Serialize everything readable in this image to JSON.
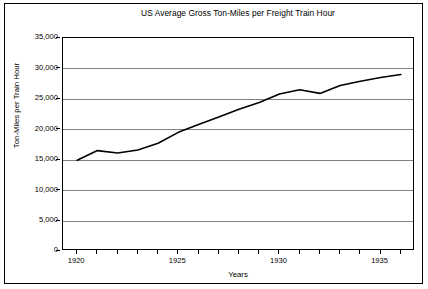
{
  "chart_data": {
    "type": "line",
    "title": "US Average Gross Ton-Miles per Freight Train Hour",
    "xlabel": "Years",
    "ylabel": "Ton-Miles per Train Hour",
    "x": [
      1920,
      1921,
      1922,
      1923,
      1924,
      1925,
      1926,
      1927,
      1928,
      1929,
      1930,
      1931,
      1932,
      1933,
      1934,
      1935,
      1936
    ],
    "values": [
      14900,
      16500,
      16100,
      16600,
      17700,
      19500,
      20800,
      22000,
      23300,
      24400,
      25800,
      26500,
      25900,
      27200,
      27900,
      28500,
      29000
    ],
    "series": [
      {
        "name": "US Average Gross Ton-Miles per Freight Train Hour",
        "values": [
          14900,
          16500,
          16100,
          16600,
          17700,
          19500,
          20800,
          22000,
          23300,
          24400,
          25800,
          26500,
          25900,
          27200,
          27900,
          28500,
          29000
        ]
      }
    ],
    "xlim": [
      1919.3,
      1936.7
    ],
    "ylim": [
      0,
      35000
    ],
    "y_ticks": [
      0,
      5000,
      10000,
      15000,
      20000,
      25000,
      30000,
      35000
    ],
    "y_tick_labels": [
      "0",
      "5,000",
      "10,000",
      "15,000",
      "20,000",
      "25,000",
      "30,000",
      "35,000"
    ],
    "x_ticks": [
      1920,
      1921,
      1922,
      1923,
      1924,
      1925,
      1926,
      1927,
      1928,
      1929,
      1930,
      1931,
      1932,
      1933,
      1934,
      1935,
      1936
    ],
    "x_tick_labels_shown": [
      {
        "value": 1920,
        "label": "1920"
      },
      {
        "value": 1925,
        "label": "1925"
      },
      {
        "value": 1930,
        "label": "1930"
      },
      {
        "value": 1935,
        "label": "1935"
      }
    ],
    "grid": "horizontal",
    "legend": "none",
    "colors": {
      "line": "#000000",
      "gridline": "#808080",
      "axis": "#000000",
      "plot_background": "#ffffff",
      "frame": "#000000"
    }
  }
}
